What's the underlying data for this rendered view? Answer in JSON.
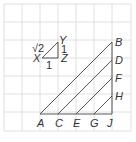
{
  "diagram": {
    "grid": {
      "x0": 4,
      "y0": 4,
      "cell": 18,
      "cols": 7,
      "rows": 7,
      "color": "#d8d8d8"
    },
    "line_color": "#444444",
    "small_triangle": {
      "vertices": {
        "X": "X",
        "Y": "Y",
        "Z": "Z"
      },
      "hypotenuse_label": "√2",
      "vertical_leg_label": "1",
      "horizontal_leg_label": "1"
    },
    "large_figure": {
      "bottom_points": [
        "A",
        "C",
        "E",
        "G",
        "J"
      ],
      "right_points": [
        "B",
        "D",
        "F",
        "H"
      ]
    }
  }
}
